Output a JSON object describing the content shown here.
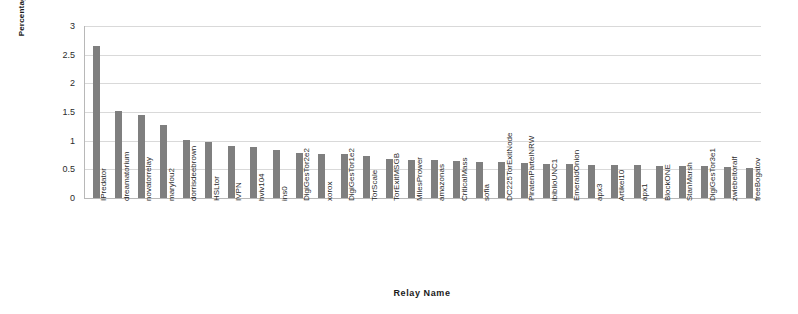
{
  "chart_data": {
    "type": "bar",
    "title": "",
    "xlabel": "Relay Name",
    "ylabel": "Percentage (%)",
    "ylim": [
      0,
      3
    ],
    "yticks": [
      0,
      0.5,
      1,
      1.5,
      2,
      2.5,
      3
    ],
    "ytick_labels": [
      "0",
      "0.5",
      "1",
      "1.5",
      "2",
      "2.5",
      "3"
    ],
    "grid": true,
    "legend": null,
    "bar_color": "#7f7f7f",
    "gridline_color": "#d9d9d9",
    "axis_color": "#b8b8b8",
    "categories": [
      "IPredator",
      "dreamatorium",
      "novatorrelay",
      "marylou2",
      "dorrisdeebrown",
      "HSLtor",
      "IVPN",
      "hviv104",
      "ins0",
      "DigiGesTor2e2",
      "xorox",
      "DigiGesTor1e2",
      "TorScale",
      "TorExitMSGB",
      "MilesPrower",
      "amazonas",
      "CriticalMass",
      "sofia",
      "DC225TorExitNode",
      "PiratenParteiNRW",
      "ibiblioUNC1",
      "EmeraldOnion",
      "apx3",
      "Artikel10",
      "apx1",
      "BlockONE",
      "StanMarsh",
      "DigiGesTor3e1",
      "zwiebeltoralf",
      "freeBogatov"
    ],
    "values": [
      2.66,
      1.52,
      1.45,
      1.27,
      1.02,
      0.97,
      0.91,
      0.89,
      0.84,
      0.79,
      0.77,
      0.76,
      0.74,
      0.68,
      0.67,
      0.66,
      0.65,
      0.63,
      0.62,
      0.61,
      0.6,
      0.59,
      0.58,
      0.57,
      0.57,
      0.56,
      0.55,
      0.55,
      0.54,
      0.53
    ]
  }
}
